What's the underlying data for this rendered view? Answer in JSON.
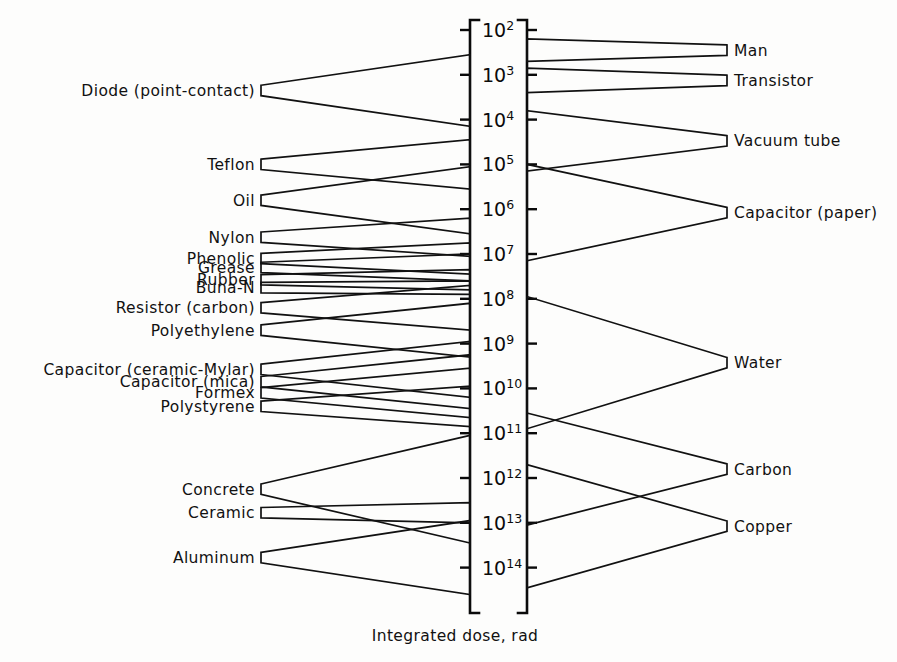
{
  "caption": "Integrated dose, rad",
  "axis": {
    "name": "integrated-dose-axis",
    "tick_labels": [
      "10²",
      "10³",
      "10⁴",
      "10⁵",
      "10⁶",
      "10⁷",
      "10⁸",
      "10⁹",
      "10¹⁰",
      "10¹¹",
      "10¹²",
      "10¹³",
      "10¹⁴"
    ],
    "tick_bases": [
      "10",
      "10",
      "10",
      "10",
      "10",
      "10",
      "10",
      "10",
      "10",
      "10",
      "10",
      "10",
      "10"
    ],
    "tick_exponents": [
      "2",
      "3",
      "4",
      "5",
      "6",
      "7",
      "8",
      "9",
      "10",
      "11",
      "12",
      "13",
      "14"
    ],
    "min_exponent": 2,
    "max_exponent": 14
  },
  "left_items": [
    {
      "label": "Diode (point-contact)",
      "from_exp": 2.55,
      "to_exp": 4.15
    },
    {
      "label": "Teflon",
      "from_exp": 4.45,
      "to_exp": 5.55
    },
    {
      "label": "Oil",
      "from_exp": 5.05,
      "to_exp": 6.55
    },
    {
      "label": "Nylon",
      "from_exp": 6.2,
      "to_exp": 7.05
    },
    {
      "label": "Phenolic",
      "from_exp": 6.75,
      "to_exp": 7.45
    },
    {
      "label": "Grease",
      "from_exp": 7.0,
      "to_exp": 7.6
    },
    {
      "label": "Rubber",
      "from_exp": 7.35,
      "to_exp": 7.8
    },
    {
      "label": "Buna-N",
      "from_exp": 7.6,
      "to_exp": 7.9
    },
    {
      "label": "Resistor (carbon)",
      "from_exp": 7.7,
      "to_exp": 8.7
    },
    {
      "label": "Polyethylene",
      "from_exp": 8.1,
      "to_exp": 9.3
    },
    {
      "label": "Capacitor (ceramic-Mylar)",
      "from_exp": 8.95,
      "to_exp": 10.2
    },
    {
      "label": "Capacitor (mica)",
      "from_exp": 9.25,
      "to_exp": 10.45
    },
    {
      "label": "Formex",
      "from_exp": 9.55,
      "to_exp": 10.65
    },
    {
      "label": "Polystyrene",
      "from_exp": 9.95,
      "to_exp": 10.85
    },
    {
      "label": "Concrete",
      "from_exp": 11.05,
      "to_exp": 13.45
    },
    {
      "label": "Ceramic",
      "from_exp": 12.55,
      "to_exp": 13.0
    },
    {
      "label": "Aluminum",
      "from_exp": 12.95,
      "to_exp": 14.6
    }
  ],
  "right_items": [
    {
      "label": "Man",
      "from_exp": 2.2,
      "to_exp": 2.7
    },
    {
      "label": "Transistor",
      "from_exp": 2.85,
      "to_exp": 3.4
    },
    {
      "label": "Vacuum tube",
      "from_exp": 3.8,
      "to_exp": 5.15
    },
    {
      "label": "Capacitor (paper)",
      "from_exp": 5.0,
      "to_exp": 7.15
    },
    {
      "label": "Water",
      "from_exp": 7.95,
      "to_exp": 10.9
    },
    {
      "label": "Carbon",
      "from_exp": 10.55,
      "to_exp": 13.05
    },
    {
      "label": "Copper",
      "from_exp": 11.7,
      "to_exp": 14.45
    }
  ],
  "colors": {
    "ink": "#111111",
    "paper": "#fdfdfc"
  },
  "geometry": {
    "axis_left_x": 470,
    "axis_right_x": 527,
    "top_y": 30,
    "bottom_y": 613,
    "decade_px": 44.8,
    "left_bracket_x": 261,
    "right_bracket_x": 727,
    "left_label_x": 255,
    "right_label_x": 734,
    "caption_x": 455,
    "caption_y": 641
  }
}
